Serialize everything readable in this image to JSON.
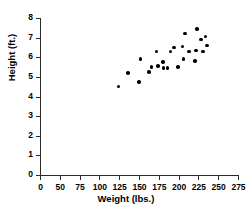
{
  "chart_data": {
    "type": "scatter",
    "title": "",
    "xlabel": "Weight (lbs.)",
    "ylabel": "Height (ft.)",
    "xlim": [
      0,
      275
    ],
    "ylim": [
      0,
      8
    ],
    "grid": false,
    "legend": null,
    "xticks": [
      {
        "value": 0,
        "label": "0"
      },
      {
        "value": 50,
        "label": "50"
      },
      {
        "value": 75,
        "label": "75"
      },
      {
        "value": 100,
        "label": "100"
      },
      {
        "value": 125,
        "label": "125"
      },
      {
        "value": 150,
        "label": "150"
      },
      {
        "value": 175,
        "label": "175"
      },
      {
        "value": 200,
        "label": "200"
      },
      {
        "value": 225,
        "label": "225"
      },
      {
        "value": 250,
        "label": "250"
      },
      {
        "value": 275,
        "label": "275"
      }
    ],
    "yticks": [
      {
        "value": 0,
        "label": "0"
      },
      {
        "value": 1,
        "label": "1"
      },
      {
        "value": 2,
        "label": "2"
      },
      {
        "value": 3,
        "label": "3"
      },
      {
        "value": 4,
        "label": "4"
      },
      {
        "value": 5,
        "label": "5"
      },
      {
        "value": 6,
        "label": "6"
      },
      {
        "value": 7,
        "label": "7"
      },
      {
        "value": 8,
        "label": "8"
      }
    ],
    "marker": {
      "shape": "circle",
      "color": "#000000",
      "size": 3.6
    },
    "points": [
      {
        "x": 124,
        "y": 4.5
      },
      {
        "x": 136,
        "y": 5.2
      },
      {
        "x": 150,
        "y": 4.75
      },
      {
        "x": 152,
        "y": 5.9
      },
      {
        "x": 163,
        "y": 5.25
      },
      {
        "x": 166,
        "y": 5.5
      },
      {
        "x": 172,
        "y": 6.3
      },
      {
        "x": 174,
        "y": 5.55
      },
      {
        "x": 180,
        "y": 5.75
      },
      {
        "x": 181,
        "y": 5.45
      },
      {
        "x": 186,
        "y": 5.45
      },
      {
        "x": 190,
        "y": 6.3
      },
      {
        "x": 194,
        "y": 6.5
      },
      {
        "x": 199,
        "y": 5.5
      },
      {
        "x": 205,
        "y": 6.55
      },
      {
        "x": 206,
        "y": 5.9
      },
      {
        "x": 208,
        "y": 7.2
      },
      {
        "x": 213,
        "y": 6.3
      },
      {
        "x": 221,
        "y": 5.8
      },
      {
        "x": 222,
        "y": 6.35
      },
      {
        "x": 223,
        "y": 7.45
      },
      {
        "x": 228,
        "y": 6.9
      },
      {
        "x": 231,
        "y": 6.3
      },
      {
        "x": 234,
        "y": 7.05
      },
      {
        "x": 236,
        "y": 6.6
      }
    ]
  },
  "axis_color": "#2b2b2b"
}
